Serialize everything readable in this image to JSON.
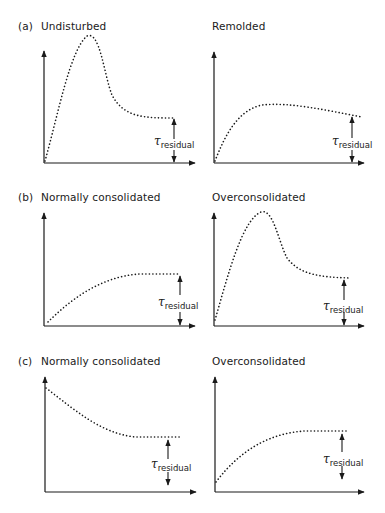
{
  "rows": [
    {
      "label": "(a)",
      "panels": [
        {
          "title": "Undisturbed",
          "annotation": {
            "symbol": "τ",
            "subscript": "residual"
          }
        },
        {
          "title": "Remolded",
          "annotation": {
            "symbol": "τ",
            "subscript": "residual"
          }
        }
      ]
    },
    {
      "label": "(b)",
      "panels": [
        {
          "title": "Normally consolidated",
          "annotation": {
            "symbol": "τ",
            "subscript": "residual"
          }
        },
        {
          "title": "Overconsolidated",
          "annotation": {
            "symbol": "τ",
            "subscript": "residual"
          }
        }
      ]
    },
    {
      "label": "(c)",
      "panels": [
        {
          "title": "Normally consolidated",
          "annotation": {
            "symbol": "τ",
            "subscript": "residual"
          }
        },
        {
          "title": "Overconsolidated",
          "annotation": {
            "symbol": "τ",
            "subscript": "residual"
          }
        }
      ]
    }
  ],
  "colors": {
    "ink": "#1a1a1a",
    "background": "#ffffff"
  }
}
